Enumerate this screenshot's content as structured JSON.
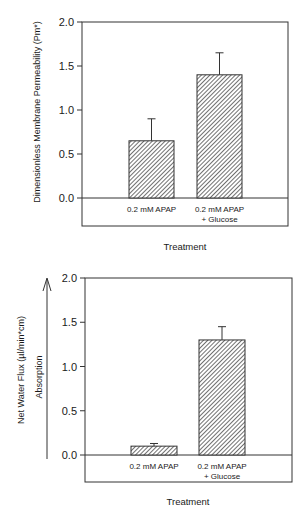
{
  "chart_data": [
    {
      "type": "bar",
      "title": "",
      "xlabel": "Treatment",
      "ylabel": "Dimensionless Membrane Permeability (Pm*)",
      "categories": [
        "0.2 mM APAP",
        "0.2 mM APAP + Glucose"
      ],
      "category_lines": [
        [
          "0.2 mM APAP"
        ],
        [
          "0.2 mM APAP",
          "+ Glucose"
        ]
      ],
      "values": [
        0.65,
        1.4
      ],
      "error_upper": [
        0.9,
        1.65
      ],
      "errors": [
        0.25,
        0.25
      ],
      "ylim": [
        0.0,
        2.0
      ],
      "yticks": [
        "0.0",
        "0.5",
        "1.0",
        "1.5",
        "2.0"
      ],
      "grid": false,
      "legend": null,
      "bar_pattern": "diagonal-hatch"
    },
    {
      "type": "bar",
      "title": "",
      "xlabel": "Treatment",
      "ylabel": "Net Water Flux (µl/min*cm)",
      "annotation": "Absorption",
      "annotation_arrow": "up",
      "categories": [
        "0.2 mM APAP",
        "0.2 mM APAP + Glucose"
      ],
      "category_lines": [
        [
          "0.2 mM APAP"
        ],
        [
          "0.2 mM APAP",
          "+ Glucose"
        ]
      ],
      "values": [
        0.1,
        1.3
      ],
      "error_upper": [
        0.13,
        1.45
      ],
      "errors": [
        0.03,
        0.15
      ],
      "ylim": [
        0.0,
        2.0
      ],
      "yticks": [
        "0.0",
        "0.5",
        "1.0",
        "1.5",
        "2.0"
      ],
      "grid": false,
      "legend": null,
      "bar_pattern": "diagonal-hatch"
    }
  ]
}
